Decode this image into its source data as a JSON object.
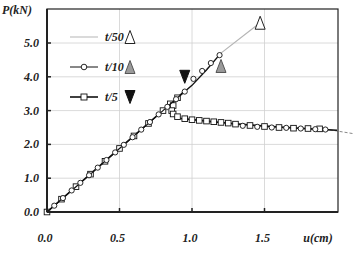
{
  "chart_data": {
    "type": "line",
    "title": "",
    "xlabel": "u(cm)",
    "ylabel": "P(kN)",
    "xlim": [
      0.0,
      2.0
    ],
    "ylim": [
      0.0,
      6.0
    ],
    "x_ticks": [
      "0.0",
      "0.5",
      "1.0",
      "1.5"
    ],
    "y_ticks": [
      "0.0",
      "1.0",
      "2.0",
      "3.0",
      "4.0",
      "5.0"
    ],
    "grid": true,
    "legend_position": "upper-left",
    "series": [
      {
        "name": "t/50",
        "style": "thin grey line",
        "marker_triangle": "open",
        "points": [
          [
            0,
            0
          ],
          [
            0.5,
            1.9
          ],
          [
            0.88,
            3.3
          ],
          [
            1.0,
            3.75
          ],
          [
            1.2,
            4.7
          ],
          [
            1.47,
            5.6
          ]
        ],
        "end_marker": [
          1.47,
          5.6
        ]
      },
      {
        "name": "t/10",
        "style": "line with open circles",
        "marker_triangle": "grey filled",
        "points": [
          [
            0,
            0
          ],
          [
            0.1,
            0.38
          ],
          [
            0.2,
            0.75
          ],
          [
            0.3,
            1.12
          ],
          [
            0.4,
            1.5
          ],
          [
            0.5,
            1.88
          ],
          [
            0.6,
            2.25
          ],
          [
            0.7,
            2.62
          ],
          [
            0.8,
            3.0
          ],
          [
            0.9,
            3.38
          ],
          [
            1.0,
            3.75
          ],
          [
            1.1,
            4.2
          ],
          [
            1.2,
            4.7
          ]
        ],
        "end_marker": [
          1.2,
          4.3
        ]
      },
      {
        "name": "t/5",
        "style": "line with open squares",
        "marker_triangle": "black filled inverted",
        "points": [
          [
            0,
            0
          ],
          [
            0.2,
            0.75
          ],
          [
            0.4,
            1.5
          ],
          [
            0.6,
            2.25
          ],
          [
            0.8,
            3.0
          ],
          [
            0.9,
            3.35
          ],
          [
            0.93,
            3.5
          ],
          [
            0.88,
            3.25
          ],
          [
            0.86,
            3.0
          ],
          [
            0.88,
            2.85
          ],
          [
            0.95,
            2.75
          ],
          [
            1.05,
            2.7
          ],
          [
            1.2,
            2.63
          ],
          [
            1.4,
            2.55
          ],
          [
            1.6,
            2.5
          ],
          [
            1.8,
            2.47
          ],
          [
            2.0,
            2.43
          ]
        ],
        "end_marker": [
          0.95,
          3.95
        ]
      }
    ]
  },
  "axes": {
    "y_label": "P(kN)",
    "x_label": "u(cm)",
    "y_ticks": [
      "0.0",
      "1.0",
      "2.0",
      "3.0",
      "4.0",
      "5.0"
    ],
    "x_ticks": [
      "0.0",
      "0.5",
      "1.0",
      "1.5"
    ]
  },
  "legend": [
    {
      "label": "t/50"
    },
    {
      "label": "t/10"
    },
    {
      "label": "t/5"
    }
  ],
  "colors": {
    "axis": "#222222",
    "grid": "#d0d0d0",
    "t50_line": "#b5b5b5",
    "t10_triangle": "#9a9a9a",
    "t5_triangle": "#111111"
  }
}
